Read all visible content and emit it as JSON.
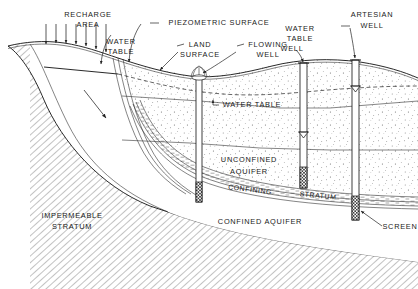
{
  "figure": {
    "type": "hydrogeology-cross-section",
    "background_color": "#ffffff",
    "line_color": "#111111",
    "text_color": "#1a1a1a",
    "width": 418,
    "height": 289
  },
  "labels": {
    "recharge_area": "RECHARGE\nAREA",
    "recharge_area_line1": "RECHARGE",
    "recharge_area_line2": "AREA",
    "water_table_left_line1": "WATER",
    "water_table_left_line2": "TABLE",
    "piezometric_surface": "PIEZOMETRIC SURFACE",
    "land_surface_line1": "LAND",
    "land_surface_line2": "SURFACE",
    "flowing_well_line1": "FLOWING",
    "flowing_well_line2": "WELL",
    "water_table_well_line1": "WATER",
    "water_table_well_line2": "TABLE",
    "water_table_well_line3": "WELL",
    "artesian_well_line1": "ARTESIAN",
    "artesian_well_line2": "WELL",
    "water_table_mid": "WATER TABLE",
    "unconfined_aquifer_line1": "UNCONFINED",
    "unconfined_aquifer_line2": "AQUIFER",
    "confining_stratum_word1": "CONFINING",
    "confining_stratum_word2": "STRATUM",
    "confined_aquifer": "CONFINED  AQUIFER",
    "impermeable_stratum_line1": "IMPERMEABLE",
    "impermeable_stratum_line2": "STRATUM",
    "screen": "SCREEN"
  },
  "features": {
    "recharge_arrow_count": 7,
    "flow_direction_arrow": "diagonal-down-right",
    "wells": [
      {
        "name": "flowing-well",
        "has_spray": true,
        "screened": true
      },
      {
        "name": "water-table-well",
        "has_water_level_marker": true,
        "screened": true
      },
      {
        "name": "artesian-well",
        "has_water_level_marker": true,
        "screened": true
      }
    ],
    "strata": [
      "impermeable-stratum",
      "unconfined-aquifer",
      "confining-stratum",
      "confined-aquifer"
    ],
    "surfaces": [
      "land-surface",
      "water-table",
      "piezometric-surface"
    ]
  }
}
